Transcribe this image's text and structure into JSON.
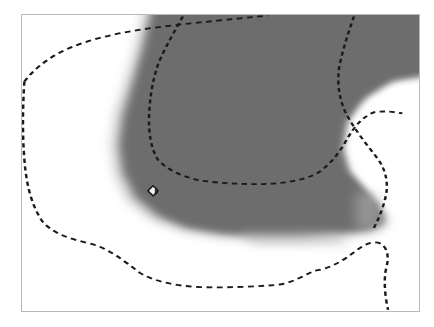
{
  "figure": {
    "type": "contour-map",
    "width": 434,
    "height": 327,
    "background_color": "#ffffff",
    "frame": {
      "x": 21,
      "y": 14,
      "width": 399,
      "height": 298,
      "border_color": "#b9b9b9",
      "border_width": 1
    }
  },
  "palette": {
    "page_background": "#ffffff",
    "field_low": "#ffffff",
    "field_high": "#6d6d6d",
    "field_mid": "#a8a8a8",
    "contour_line": "#1a1a1a",
    "marker_fill": "#f2f2f2",
    "marker_stroke": "#1a1a1a",
    "frame_border": "#b9b9b9"
  },
  "chart_data": {
    "type": "heatmap",
    "title": "",
    "subtitle": "",
    "xlabel": "",
    "ylabel": "",
    "grid": false,
    "legend": "none",
    "axis_ticks": [],
    "tick_labels": [],
    "annotations": [],
    "shaded_regions": [
      {
        "name": "high-value-lobe",
        "fill": "#6d6d6d",
        "level_label": "",
        "polygon_percent": [
          [
            33.5,
            0
          ],
          [
            100,
            0
          ],
          [
            100,
            22
          ],
          [
            92,
            24
          ],
          [
            85.5,
            29
          ],
          [
            81.5,
            36
          ],
          [
            80.5,
            45
          ],
          [
            82,
            52
          ],
          [
            86,
            58
          ],
          [
            90,
            63
          ],
          [
            91,
            70
          ],
          [
            88,
            72
          ],
          [
            80,
            73
          ],
          [
            70,
            74
          ],
          [
            60,
            74
          ],
          [
            50,
            73
          ],
          [
            41,
            71
          ],
          [
            34,
            67
          ],
          [
            28.5,
            61
          ],
          [
            25.5,
            53
          ],
          [
            24.5,
            44
          ],
          [
            25.5,
            34
          ],
          [
            27.5,
            24
          ],
          [
            30,
            12
          ]
        ]
      },
      {
        "name": "white-notch-right",
        "fill": "#ffffff",
        "level_label": "",
        "polygon_percent": [
          [
            100,
            21
          ],
          [
            93,
            23
          ],
          [
            86.5,
            28.5
          ],
          [
            82.5,
            36
          ],
          [
            81.5,
            45
          ],
          [
            83.5,
            53
          ],
          [
            88,
            60
          ],
          [
            91.5,
            66
          ],
          [
            100,
            66
          ]
        ]
      },
      {
        "name": "low-value-background",
        "fill": "#ffffff",
        "level_label": ""
      }
    ],
    "contours": [
      {
        "name": "outer-contour",
        "level_label": "",
        "style": "dashed",
        "color": "#1a1a1a",
        "stroke_width": 2,
        "dash_pattern": "5 4",
        "points_percent": [
          [
            0.5,
            22.5
          ],
          [
            2.0,
            20.0
          ],
          [
            4.0,
            17.5
          ],
          [
            6.5,
            15.0
          ],
          [
            9.5,
            12.5
          ],
          [
            13.5,
            10.0
          ],
          [
            18.0,
            8.0
          ],
          [
            23.0,
            6.5
          ],
          [
            28.5,
            5.0
          ],
          [
            34.0,
            4.0
          ],
          [
            39.0,
            3.2
          ],
          [
            44.0,
            2.6
          ],
          [
            49.0,
            2.0
          ],
          [
            54.0,
            1.4
          ],
          [
            58.5,
            0.8
          ],
          [
            62.0,
            0.2
          ]
        ]
      },
      {
        "name": "outer-contour-left-branch",
        "level_label": "",
        "style": "dashed",
        "color": "#1a1a1a",
        "stroke_width": 2,
        "dash_pattern": "5 4",
        "points_percent": [
          [
            0.6,
            22.5
          ],
          [
            0.4,
            30.0
          ],
          [
            0.3,
            38.0
          ],
          [
            0.4,
            46.0
          ],
          [
            0.8,
            54.0
          ],
          [
            1.6,
            61.0
          ],
          [
            3.0,
            67.0
          ],
          [
            5.5,
            71.5
          ],
          [
            9.0,
            74.5
          ],
          [
            13.0,
            76.0
          ],
          [
            17.5,
            77.5
          ],
          [
            21.5,
            80.0
          ],
          [
            25.0,
            83.5
          ],
          [
            28.5,
            87.0
          ],
          [
            32.5,
            89.5
          ],
          [
            37.5,
            91.0
          ],
          [
            43.0,
            91.8
          ],
          [
            49.0,
            92.0
          ],
          [
            55.0,
            91.8
          ],
          [
            60.5,
            91.5
          ],
          [
            65.0,
            91.0
          ],
          [
            68.5,
            89.5
          ],
          [
            71.0,
            87.5
          ],
          [
            73.5,
            86.5
          ],
          [
            77.0,
            86.0
          ],
          [
            80.5,
            84.0
          ],
          [
            83.5,
            80.5
          ],
          [
            86.5,
            77.5
          ],
          [
            89.0,
            76.5
          ],
          [
            91.0,
            77.5
          ],
          [
            92.0,
            80.0
          ],
          [
            92.3,
            83.0
          ],
          [
            91.5,
            85.5
          ],
          [
            91.3,
            88.5
          ],
          [
            91.6,
            92.0
          ],
          [
            92.0,
            96.0
          ],
          [
            92.2,
            99.5
          ]
        ]
      },
      {
        "name": "inner-contour",
        "level_label": "",
        "style": "dashed",
        "color": "#1a1a1a",
        "stroke_width": 2,
        "dash_pattern": "5 4",
        "points_percent": [
          [
            40.5,
            0.5
          ],
          [
            39.0,
            4.0
          ],
          [
            37.0,
            8.0
          ],
          [
            35.0,
            13.0
          ],
          [
            33.5,
            18.5
          ],
          [
            32.5,
            24.0
          ],
          [
            32.0,
            30.0
          ],
          [
            32.0,
            36.0
          ],
          [
            32.5,
            41.5
          ],
          [
            33.5,
            46.5
          ],
          [
            35.5,
            50.5
          ],
          [
            38.5,
            53.5
          ],
          [
            42.5,
            55.5
          ],
          [
            47.0,
            56.5
          ],
          [
            52.0,
            57.0
          ],
          [
            57.0,
            57.2
          ],
          [
            62.0,
            57.0
          ],
          [
            67.0,
            56.5
          ],
          [
            71.5,
            55.0
          ],
          [
            75.0,
            52.5
          ],
          [
            78.0,
            49.0
          ],
          [
            80.5,
            44.5
          ],
          [
            82.5,
            40.0
          ],
          [
            84.5,
            36.0
          ],
          [
            87.0,
            33.5
          ],
          [
            90.0,
            32.5
          ],
          [
            93.0,
            32.8
          ],
          [
            95.5,
            33.2
          ]
        ]
      },
      {
        "name": "inner-contour-upper-right",
        "level_label": "",
        "style": "dashed",
        "color": "#1a1a1a",
        "stroke_width": 2,
        "dash_pattern": "5 4",
        "points_percent": [
          [
            83.5,
            0.5
          ],
          [
            82.5,
            4.0
          ],
          [
            81.5,
            8.5
          ],
          [
            80.5,
            13.5
          ],
          [
            79.5,
            19.0
          ],
          [
            79.5,
            24.5
          ],
          [
            80.5,
            29.5
          ],
          [
            82.0,
            34.0
          ],
          [
            84.0,
            38.5
          ],
          [
            86.5,
            43.0
          ],
          [
            89.0,
            47.5
          ],
          [
            91.0,
            52.0
          ],
          [
            92.0,
            57.0
          ],
          [
            91.5,
            62.0
          ],
          [
            90.0,
            67.0
          ],
          [
            88.5,
            72.0
          ]
        ]
      }
    ],
    "markers": [
      {
        "name": "station-marker",
        "shape": "diamond",
        "x_percent": 33.0,
        "y_percent": 59.5,
        "label": "",
        "fill": "#f2f2f2",
        "stroke": "#1a1a1a"
      }
    ]
  }
}
